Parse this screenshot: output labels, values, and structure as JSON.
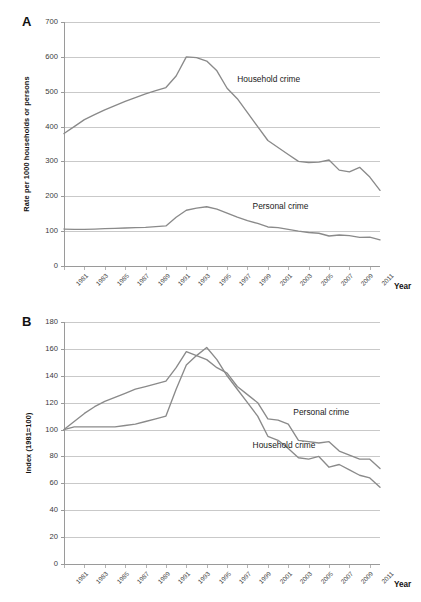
{
  "figure": {
    "panelA_letter": "A",
    "panelB_letter": "B",
    "xaxis_title": "Year"
  },
  "chart_data": [
    {
      "panel": "A",
      "type": "line",
      "title": "",
      "xlabel": "Year",
      "ylabel": "Rate per 1000 households or persons",
      "ylim": [
        0,
        700
      ],
      "ytick_labels": [
        "0",
        "100",
        "200",
        "300",
        "400",
        "500",
        "600",
        "700"
      ],
      "yticks": [
        0,
        100,
        200,
        300,
        400,
        500,
        600,
        700
      ],
      "xlim": [
        1981,
        2012
      ],
      "xtick_labels": [
        "1981",
        "1983",
        "1985",
        "1987",
        "1989",
        "1991",
        "1993",
        "1995",
        "1997",
        "1999",
        "2001",
        "2003",
        "2005",
        "2007",
        "2009",
        "2011"
      ],
      "xticks": [
        1981,
        1983,
        1985,
        1987,
        1989,
        1991,
        1993,
        1995,
        1997,
        1999,
        2001,
        2003,
        2005,
        2007,
        2009,
        2011
      ],
      "grid": true,
      "legend_position": "inline-annotation",
      "x": [
        1981,
        1982,
        1983,
        1984,
        1985,
        1986,
        1987,
        1988,
        1989,
        1990,
        1991,
        1992,
        1993,
        1994,
        1995,
        1996,
        1997,
        1998,
        1999,
        2000,
        2001,
        2002,
        2003,
        2004,
        2005,
        2006,
        2007,
        2008,
        2009,
        2010,
        2011,
        2012
      ],
      "series": [
        {
          "name": "Household crime",
          "label": "Household crime",
          "color": "#8a8a8a",
          "values": [
            380,
            400,
            420,
            434,
            448,
            460,
            472,
            483,
            494,
            503,
            512,
            545,
            600,
            598,
            588,
            560,
            510,
            480,
            440,
            400,
            360,
            340,
            320,
            300,
            297,
            298,
            304,
            275,
            270,
            283,
            255,
            217
          ]
        },
        {
          "name": "Personal crime",
          "label": "Personal crime",
          "color": "#8a8a8a",
          "values": [
            106,
            105,
            105,
            106,
            107,
            108,
            109,
            110,
            111,
            113,
            115,
            140,
            160,
            166,
            170,
            163,
            152,
            140,
            130,
            122,
            112,
            110,
            105,
            100,
            96,
            94,
            86,
            89,
            87,
            82,
            83,
            75
          ]
        }
      ],
      "annotations": [
        {
          "text": "Household crime",
          "x": 1998,
          "y": 535
        },
        {
          "text": "Personal crime",
          "x": 1999.5,
          "y": 168
        }
      ]
    },
    {
      "panel": "B",
      "type": "line",
      "title": "",
      "xlabel": "Year",
      "ylabel": "Index (1981=100)",
      "ylim": [
        0,
        180
      ],
      "ytick_labels": [
        "0",
        "20",
        "40",
        "60",
        "80",
        "100",
        "120",
        "140",
        "160",
        "180"
      ],
      "yticks": [
        0,
        20,
        40,
        60,
        80,
        100,
        120,
        140,
        160,
        180
      ],
      "xlim": [
        1981,
        2012
      ],
      "xtick_labels": [
        "1981",
        "1983",
        "1985",
        "1987",
        "1989",
        "1991",
        "1993",
        "1995",
        "1997",
        "1999",
        "2001",
        "2003",
        "2005",
        "2007",
        "2009",
        "2011"
      ],
      "xticks": [
        1981,
        1983,
        1985,
        1987,
        1989,
        1991,
        1993,
        1995,
        1997,
        1999,
        2001,
        2003,
        2005,
        2007,
        2009,
        2011
      ],
      "grid": true,
      "legend_position": "inline-annotation",
      "x": [
        1981,
        1982,
        1983,
        1984,
        1985,
        1986,
        1987,
        1988,
        1989,
        1990,
        1991,
        1992,
        1993,
        1994,
        1995,
        1996,
        1997,
        1998,
        1999,
        2000,
        2001,
        2002,
        2003,
        2004,
        2005,
        2006,
        2007,
        2008,
        2009,
        2010,
        2011,
        2012
      ],
      "series": [
        {
          "name": "Personal crime",
          "label": "Personal crime",
          "color": "#8a8a8a",
          "values": [
            100,
            106,
            112,
            117,
            121,
            124,
            127,
            130,
            132,
            134,
            136,
            146,
            158,
            155,
            152,
            146,
            142,
            132,
            126,
            120,
            108,
            107,
            104,
            92,
            91,
            90,
            91,
            84,
            81,
            78,
            78,
            71
          ]
        },
        {
          "name": "Household crime",
          "label": "Household crime",
          "color": "#8a8a8a",
          "values": [
            100,
            102,
            102,
            102,
            102,
            102,
            103,
            104,
            106,
            108,
            110,
            130,
            148,
            155,
            161,
            152,
            140,
            130,
            120,
            110,
            95,
            92,
            86,
            79,
            78,
            80,
            72,
            74,
            70,
            66,
            64,
            57
          ]
        }
      ],
      "annotations": [
        {
          "text": "Personal crime",
          "x": 2003.5,
          "y": 112
        },
        {
          "text": "Household crime",
          "x": 1999.5,
          "y": 88
        }
      ]
    }
  ]
}
